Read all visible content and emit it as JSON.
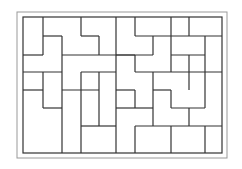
{
  "diagram": {
    "title": "",
    "outer_frame": {
      "x": 17,
      "y": 12,
      "w": 210,
      "h": 146,
      "color": "#999999"
    },
    "inner_frame": {
      "x": 23,
      "y": 17,
      "w": 199,
      "h": 136,
      "color": "#333333"
    },
    "line_color": "#333333",
    "segments": [
      [
        43,
        17,
        43,
        55
      ],
      [
        43,
        36,
        62,
        36
      ],
      [
        62,
        36,
        62,
        72
      ],
      [
        23,
        55,
        43,
        55
      ],
      [
        62,
        55,
        99,
        55
      ],
      [
        81,
        17,
        81,
        36
      ],
      [
        81,
        36,
        99,
        36
      ],
      [
        99,
        36,
        99,
        55
      ],
      [
        116,
        17,
        116,
        72
      ],
      [
        99,
        55,
        135,
        55
      ],
      [
        23,
        72,
        62,
        72
      ],
      [
        62,
        72,
        62,
        108
      ],
      [
        81,
        72,
        116,
        72
      ],
      [
        81,
        72,
        81,
        90
      ],
      [
        135,
        17,
        135,
        36
      ],
      [
        135,
        36,
        189,
        36
      ],
      [
        171,
        17,
        171,
        72
      ],
      [
        189,
        17,
        189,
        36
      ],
      [
        153,
        36,
        153,
        55
      ],
      [
        116,
        55,
        153,
        55
      ],
      [
        135,
        55,
        135,
        72
      ],
      [
        135,
        72,
        222,
        72
      ],
      [
        205,
        36,
        205,
        72
      ],
      [
        189,
        36,
        222,
        36
      ],
      [
        171,
        55,
        205,
        55
      ],
      [
        189,
        55,
        189,
        72
      ],
      [
        43,
        72,
        43,
        108
      ],
      [
        23,
        90,
        43,
        90
      ],
      [
        43,
        108,
        62,
        108
      ],
      [
        62,
        90,
        99,
        90
      ],
      [
        99,
        90,
        99,
        126
      ],
      [
        81,
        126,
        99,
        126
      ],
      [
        81,
        90,
        81,
        153
      ],
      [
        62,
        108,
        62,
        153
      ],
      [
        99,
        72,
        99,
        90
      ],
      [
        116,
        72,
        116,
        90
      ],
      [
        116,
        90,
        135,
        90
      ],
      [
        135,
        90,
        135,
        108
      ],
      [
        116,
        90,
        116,
        126
      ],
      [
        99,
        126,
        116,
        126
      ],
      [
        116,
        108,
        135,
        108
      ],
      [
        135,
        108,
        153,
        108
      ],
      [
        153,
        72,
        153,
        126
      ],
      [
        135,
        126,
        171,
        126
      ],
      [
        135,
        126,
        135,
        153
      ],
      [
        153,
        90,
        171,
        90
      ],
      [
        171,
        90,
        171,
        108
      ],
      [
        171,
        108,
        205,
        108
      ],
      [
        189,
        72,
        189,
        90
      ],
      [
        205,
        72,
        205,
        108
      ],
      [
        171,
        126,
        222,
        126
      ],
      [
        189,
        108,
        189,
        126
      ],
      [
        205,
        126,
        205,
        153
      ],
      [
        171,
        126,
        171,
        153
      ],
      [
        116,
        126,
        116,
        153
      ]
    ]
  }
}
